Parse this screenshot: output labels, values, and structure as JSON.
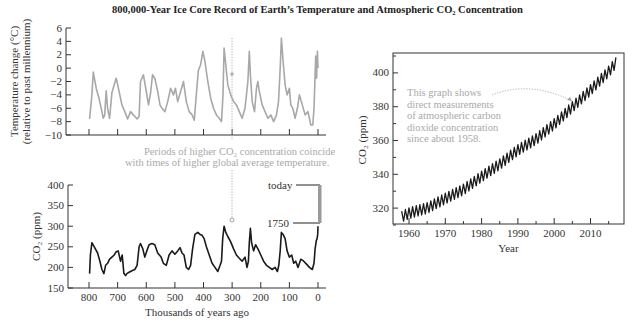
{
  "title": "800,000-Year Ice Core Record of Earth’s Temperature and Atmospheric CO₂ Concentration",
  "colors": {
    "temperature_line": "#a8a8a8",
    "co2_line": "#1a1a1a",
    "annotation_text": "#a9a9a9",
    "axis": "#333333"
  },
  "annotations": {
    "coincide_line1": "Periods of higher CO₂ concentration coincide",
    "coincide_line2": "with times of higher global average temperature.",
    "today": "today",
    "y1750": "1750",
    "mauna_loa": [
      "This graph shows",
      "direct measurements",
      "of atmospheric carbon",
      "dioxide concentration",
      "since about 1958."
    ]
  },
  "chart_data": [
    {
      "type": "line",
      "id": "ice-core-temperature",
      "title": "",
      "xlabel": "Thousands of years ago",
      "ylabel": "Temperature change (°C) (relative to past millennium)",
      "ylim": [
        -10,
        6
      ],
      "xlim": [
        800,
        0
      ],
      "yticks": [
        6,
        4,
        2,
        0,
        -2,
        -4,
        -6,
        -8,
        -10
      ],
      "xticks": [
        800,
        700,
        600,
        500,
        400,
        300,
        200,
        100,
        0
      ],
      "grid": false,
      "series": [
        {
          "name": "Temperature change",
          "x": [
            798,
            790,
            785,
            775,
            765,
            755,
            750,
            745,
            740,
            735,
            728,
            720,
            712,
            705,
            695,
            685,
            675,
            665,
            655,
            645,
            632,
            625,
            620,
            610,
            600,
            592,
            585,
            578,
            570,
            560,
            552,
            545,
            535,
            525,
            515,
            505,
            498,
            490,
            480,
            470,
            460,
            450,
            440,
            432,
            425,
            418,
            410,
            402,
            395,
            385,
            375,
            365,
            355,
            345,
            337,
            332,
            328,
            322,
            315,
            305,
            295,
            285,
            275,
            265,
            255,
            245,
            240,
            236,
            230,
            222,
            215,
            210,
            205,
            195,
            185,
            175,
            165,
            155,
            145,
            138,
            132,
            128,
            122,
            115,
            108,
            100,
            95,
            88,
            80,
            72,
            65,
            55,
            45,
            35,
            25,
            18,
            14,
            11,
            8,
            5,
            2,
            0
          ],
          "y": [
            -7.6,
            -4,
            -0.6,
            -3,
            -4.5,
            -6.5,
            -7.5,
            -7,
            -3.4,
            -6,
            -7.5,
            -3.7,
            -2.5,
            -1.5,
            -3.5,
            -5.5,
            -6.5,
            -7.6,
            -6.5,
            -7,
            -7.6,
            -7.2,
            -2,
            -1,
            -3.5,
            -5.5,
            -3.8,
            -1,
            -1.5,
            -3.5,
            -5.5,
            -6,
            -6.5,
            -5,
            -3,
            -4,
            -3,
            -5,
            -3.5,
            -2,
            -5,
            -6.5,
            -7,
            -7.8,
            -4,
            -0.4,
            0.5,
            2.5,
            1,
            -2,
            -4.5,
            -6,
            -7,
            -7.5,
            -8,
            -4,
            3,
            0.5,
            -2.5,
            -4,
            -5,
            -5.5,
            -6.5,
            -7.5,
            -6,
            -2,
            2.5,
            -1,
            -5,
            -6.5,
            -3,
            -2,
            -3.5,
            -5.5,
            -6.5,
            -7.5,
            -7,
            -8,
            -7,
            -5,
            0,
            4.5,
            1,
            -2.5,
            -4,
            -3,
            -5.5,
            -6,
            -7.5,
            -6,
            -4,
            -5.5,
            -7,
            -6.5,
            -8.5,
            -8.5,
            -6,
            -2,
            1.8,
            -1.5,
            2.5,
            0
          ]
        }
      ]
    },
    {
      "type": "line",
      "id": "ice-core-co2",
      "title": "",
      "xlabel": "Thousands of years ago",
      "ylabel": "CO₂ (ppm)",
      "ylim": [
        150,
        400
      ],
      "xlim": [
        800,
        0
      ],
      "yticks": [
        400,
        350,
        300,
        250,
        200,
        150
      ],
      "xticks": [
        800,
        700,
        600,
        500,
        400,
        300,
        200,
        100,
        0
      ],
      "grid": false,
      "series": [
        {
          "name": "CO₂",
          "x": [
            798,
            795,
            790,
            780,
            770,
            762,
            755,
            748,
            742,
            735,
            728,
            720,
            712,
            705,
            698,
            690,
            684,
            678,
            672,
            668,
            660,
            650,
            640,
            632,
            625,
            620,
            612,
            605,
            598,
            590,
            580,
            570,
            560,
            548,
            540,
            530,
            520,
            510,
            500,
            490,
            482,
            475,
            468,
            460,
            452,
            445,
            438,
            430,
            420,
            412,
            405,
            398,
            390,
            380,
            370,
            360,
            350,
            342,
            337,
            333,
            328,
            322,
            315,
            305,
            295,
            285,
            275,
            265,
            255,
            248,
            243,
            240,
            236,
            232,
            225,
            218,
            210,
            200,
            190,
            180,
            170,
            160,
            150,
            142,
            137,
            132,
            128,
            122,
            115,
            108,
            100,
            92,
            85,
            78,
            70,
            60,
            50,
            40,
            30,
            20,
            14,
            10,
            6,
            3,
            1,
            0
          ],
          "y": [
            185,
            230,
            260,
            248,
            235,
            215,
            195,
            185,
            205,
            210,
            220,
            225,
            230,
            238,
            240,
            215,
            230,
            185,
            180,
            185,
            188,
            192,
            195,
            205,
            250,
            258,
            245,
            225,
            240,
            255,
            258,
            255,
            235,
            225,
            210,
            205,
            230,
            240,
            232,
            240,
            248,
            235,
            230,
            200,
            195,
            205,
            245,
            280,
            285,
            280,
            278,
            270,
            250,
            230,
            210,
            200,
            190,
            205,
            215,
            270,
            300,
            285,
            275,
            262,
            245,
            230,
            222,
            215,
            225,
            200,
            215,
            260,
            295,
            260,
            240,
            255,
            245,
            230,
            215,
            205,
            200,
            195,
            200,
            190,
            205,
            240,
            285,
            280,
            270,
            240,
            225,
            230,
            210,
            215,
            200,
            220,
            215,
            208,
            200,
            195,
            210,
            245,
            265,
            270,
            280,
            300
          ]
        }
      ]
    },
    {
      "type": "line",
      "id": "mauna-loa-co2",
      "title": "",
      "xlabel": "Year",
      "ylabel": "CO₂ (ppm)",
      "ylim": [
        310,
        410
      ],
      "xlim": [
        1957,
        2019
      ],
      "yticks": [
        320,
        340,
        360,
        380,
        400
      ],
      "xticks": [
        1960,
        1970,
        1980,
        1990,
        2000,
        2010
      ],
      "grid": false,
      "series": [
        {
          "name": "Atmospheric CO₂ (Mauna Loa)",
          "x": [
            1958,
            1960,
            1965,
            1970,
            1975,
            1980,
            1985,
            1990,
            1995,
            2000,
            2005,
            2010,
            2015,
            2017
          ],
          "y": [
            315,
            317,
            320,
            325.7,
            331,
            338.7,
            346,
            354.4,
            360.8,
            369.7,
            379.8,
            389.9,
            400.8,
            406
          ]
        }
      ]
    }
  ]
}
